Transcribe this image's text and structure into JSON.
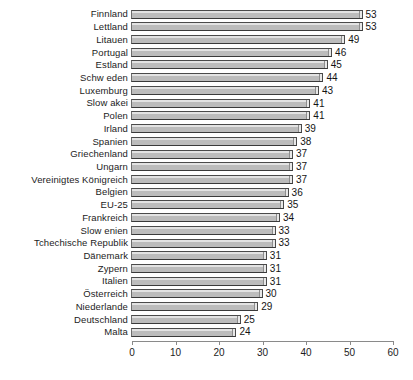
{
  "chart_data": {
    "type": "bar",
    "orientation": "horizontal",
    "title": "",
    "subtitle": "",
    "xlabel": "",
    "ylabel": "",
    "xlim": [
      0,
      60
    ],
    "ticks": [
      0,
      10,
      20,
      30,
      40,
      50,
      60
    ],
    "grid": false,
    "legend": null,
    "bar_color": "#bcbcbc",
    "categories": [
      "Finnland",
      "Lettland",
      "Litauen",
      "Portugal",
      "Estland",
      "Schw eden",
      "Luxemburg",
      "Slow akei",
      "Polen",
      "Irland",
      "Spanien",
      "Griechenland",
      "Ungarn",
      "Vereinigtes Königreich",
      "Belgien",
      "EU-25",
      "Frankreich",
      "Slow enien",
      "Tchechische Republik",
      "Dänemark",
      "Zypern",
      "Italien",
      "Österreich",
      "Niederlande",
      "Deutschland",
      "Malta"
    ],
    "values": [
      53,
      53,
      49,
      46,
      45,
      44,
      43,
      41,
      41,
      39,
      38,
      37,
      37,
      37,
      36,
      35,
      34,
      33,
      33,
      31,
      31,
      31,
      30,
      29,
      25,
      24
    ],
    "data_labels": [
      "53",
      "53",
      "49",
      "46",
      "45",
      "44",
      "43",
      "41",
      "41",
      "39",
      "38",
      "37",
      "37",
      "37",
      "36",
      "35",
      "34",
      "33",
      "33",
      "31",
      "31",
      "31",
      "30",
      "29",
      "25",
      "24"
    ]
  }
}
